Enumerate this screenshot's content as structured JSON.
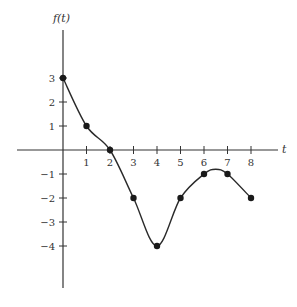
{
  "chart_data": {
    "type": "line",
    "title": "",
    "xlabel": "t",
    "ylabel": "f(t)",
    "x": [
      0,
      1,
      2,
      3,
      4,
      5,
      6,
      7,
      8
    ],
    "series": [
      {
        "name": "f(t)",
        "values": [
          3,
          1,
          0,
          -2,
          -4,
          -2,
          -1,
          -1,
          -2
        ]
      }
    ],
    "x_ticks": [
      1,
      2,
      3,
      4,
      5,
      6,
      7,
      8
    ],
    "y_ticks": [
      3,
      2,
      1,
      -1,
      -2,
      -3,
      -4
    ],
    "xlim": [
      -2,
      9
    ],
    "ylim": [
      -5.8,
      5
    ],
    "grid": false,
    "legend": "none",
    "markers": "filled-circle",
    "smooth": true,
    "colors": {
      "line": "#2a2a2a",
      "axis": "#333333"
    }
  },
  "labels": {
    "x_axis": "t",
    "y_axis": "f(t)"
  }
}
